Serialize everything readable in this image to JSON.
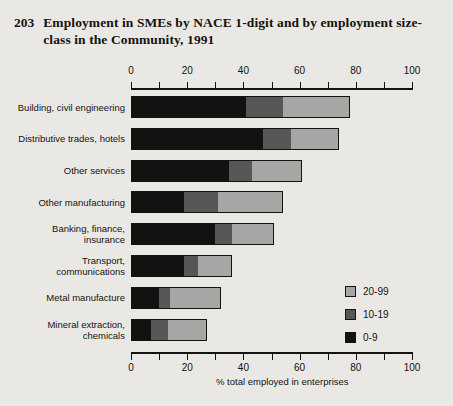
{
  "title": {
    "number": "203",
    "text": "Employment in SMEs by NACE 1-digit and by employment size-class in the Community, 1991"
  },
  "xaxis": {
    "title": "% total employed in enterprises",
    "ticks": [
      "0",
      "20",
      "40",
      "60",
      "80",
      "100"
    ]
  },
  "legend": {
    "items": [
      {
        "label": "20-99",
        "color": "#a6a6a4"
      },
      {
        "label": "10-19",
        "color": "#575755"
      },
      {
        "label": "0-9",
        "color": "#121210"
      }
    ]
  },
  "chart_data": {
    "type": "bar",
    "orientation": "horizontal",
    "stacked": true,
    "title": "Employment in SMEs by NACE 1-digit and by employment size-class in the Community, 1991",
    "xlabel": "% total employed in enterprises",
    "ylabel": "",
    "xlim": [
      0,
      100
    ],
    "xticks": [
      0,
      20,
      40,
      60,
      80,
      100
    ],
    "minor_tick_interval": 10,
    "grid": false,
    "legend_position": "right-lower",
    "categories": [
      "Building, civil engineering",
      "Distributive trades, hotels",
      "Other services",
      "Other manufacturing",
      "Banking, finance, insurance",
      "Transport, communications",
      "Metal manufacture",
      "Mineral extraction, chemicals"
    ],
    "category_lines": [
      [
        "Building, civil engineering"
      ],
      [
        "Distributive trades, hotels"
      ],
      [
        "Other services"
      ],
      [
        "Other manufacturing"
      ],
      [
        "Banking, finance,",
        "insurance"
      ],
      [
        "Transport,",
        "communications"
      ],
      [
        "Metal manufacture"
      ],
      [
        "Mineral extraction,",
        "chemicals"
      ]
    ],
    "series": [
      {
        "name": "0-9",
        "color": "#121210",
        "values": [
          41,
          47,
          35,
          19,
          30,
          19,
          10,
          7
        ]
      },
      {
        "name": "10-19",
        "color": "#575755",
        "values": [
          13,
          10,
          8,
          12,
          6,
          5,
          4,
          6
        ]
      },
      {
        "name": "20-99",
        "color": "#a6a6a4",
        "values": [
          24,
          17,
          18,
          23,
          15,
          12,
          18,
          14
        ]
      }
    ],
    "totals": [
      78,
      74,
      61,
      54,
      51,
      36,
      32,
      27
    ]
  },
  "ghost_text": {
    "lines": [
      "a new way of",
      "...nal manufacturin",
      "...be higher sha"
    ]
  }
}
